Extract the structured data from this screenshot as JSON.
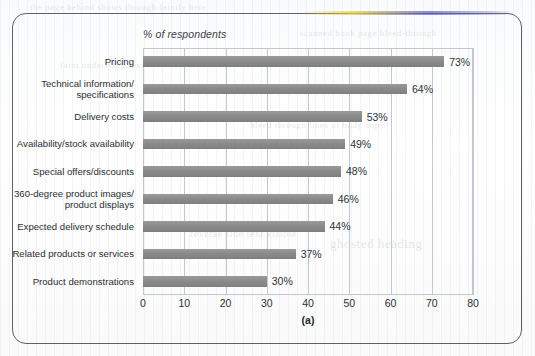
{
  "figure": {
    "caption": "(a)",
    "axis_title": "% of respondents"
  },
  "ghost_text": [
    {
      "text": "the page behind shows through faintly here",
      "x": 30,
      "y": 2,
      "size": 9
    },
    {
      "text": "scanned book page bleed-through",
      "x": 300,
      "y": 28,
      "size": 9
    },
    {
      "text": "faint underlying text",
      "x": 60,
      "y": 60,
      "size": 9
    },
    {
      "text": "bleed through lines of body copy",
      "x": 250,
      "y": 120,
      "size": 9
    },
    {
      "text": "reverse side text visible",
      "x": 190,
      "y": 228,
      "size": 10
    },
    {
      "text": "ghosted heading",
      "x": 330,
      "y": 236,
      "size": 13
    }
  ],
  "chart_data": {
    "type": "bar",
    "orientation": "horizontal",
    "title": "% of respondents",
    "xlabel": "",
    "ylabel": "",
    "xlim": [
      0,
      80
    ],
    "xticks": [
      0,
      10,
      20,
      30,
      40,
      50,
      60,
      70,
      80
    ],
    "grid": true,
    "legend": "none",
    "bar_color": "#8b8b8b",
    "categories": [
      "Pricing",
      "Technical information/\nspecifications",
      "Delivery costs",
      "Availability/stock availability",
      "Special offers/discounts",
      "360-degree product images/\nproduct displays",
      "Expected delivery schedule",
      "Related products or services",
      "Product demonstrations"
    ],
    "values": [
      73,
      64,
      53,
      49,
      48,
      46,
      44,
      37,
      30
    ],
    "value_labels": [
      "73%",
      "64%",
      "53%",
      "49%",
      "48%",
      "46%",
      "44%",
      "37%",
      "30%"
    ]
  }
}
